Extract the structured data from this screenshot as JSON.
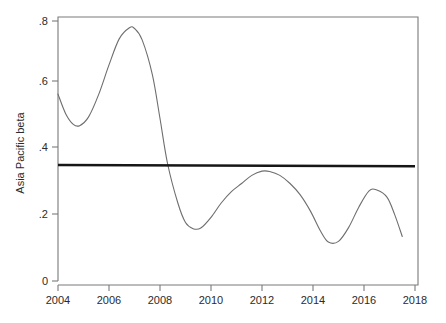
{
  "chart_data": {
    "type": "line",
    "title": "",
    "xlabel": "",
    "ylabel": "Asia Pacific beta",
    "xlim": [
      2004,
      2018
    ],
    "ylim": [
      0,
      0.8
    ],
    "grid": false,
    "legend": "none",
    "x_ticks": [
      "2004",
      "2006",
      "2008",
      "2010",
      "2012",
      "2014",
      "2016",
      "2018"
    ],
    "x_tick_values": [
      2004,
      2006,
      2008,
      2010,
      2012,
      2014,
      2016,
      2018
    ],
    "y_ticks": [
      "0",
      ".2",
      ".4",
      ".6",
      ".8"
    ],
    "y_tick_values": [
      0,
      0.2,
      0.4,
      0.6,
      0.8
    ],
    "series": [
      {
        "name": "Asia Pacific beta (smoothed)",
        "style": "thin-grey-curve",
        "color": "#6e6e6e",
        "x": [
          2004.0,
          2004.3,
          2004.6,
          2004.85,
          2005.2,
          2005.6,
          2006.0,
          2006.4,
          2006.8,
          2007.0,
          2007.3,
          2007.7,
          2008.0,
          2008.3,
          2008.7,
          2009.0,
          2009.3,
          2009.6,
          2010.0,
          2010.4,
          2010.8,
          2011.2,
          2011.6,
          2012.0,
          2012.3,
          2012.7,
          2013.1,
          2013.5,
          2013.9,
          2014.3,
          2014.6,
          2015.0,
          2015.4,
          2015.8,
          2016.2,
          2016.5,
          2016.9,
          2017.2,
          2017.5
        ],
        "y": [
          0.575,
          0.515,
          0.482,
          0.478,
          0.505,
          0.575,
          0.665,
          0.745,
          0.779,
          0.777,
          0.742,
          0.635,
          0.5,
          0.36,
          0.24,
          0.18,
          0.161,
          0.163,
          0.196,
          0.24,
          0.275,
          0.3,
          0.325,
          0.338,
          0.337,
          0.325,
          0.3,
          0.265,
          0.215,
          0.153,
          0.12,
          0.122,
          0.165,
          0.228,
          0.277,
          0.28,
          0.258,
          0.205,
          0.137
        ]
      },
      {
        "name": "Mean reference line",
        "style": "thick-black-horizontal",
        "color": "#161616",
        "x": [
          2004,
          2018
        ],
        "y": [
          0.357,
          0.353
        ]
      }
    ],
    "annotations": [],
    "notes": {
      "peak_value": 0.779,
      "peak_year": 2007,
      "trough_value": 0.12,
      "trough_year": 2014.6,
      "reference_level": 0.355
    }
  },
  "axis": {
    "y_title": "Asia Pacific beta"
  }
}
